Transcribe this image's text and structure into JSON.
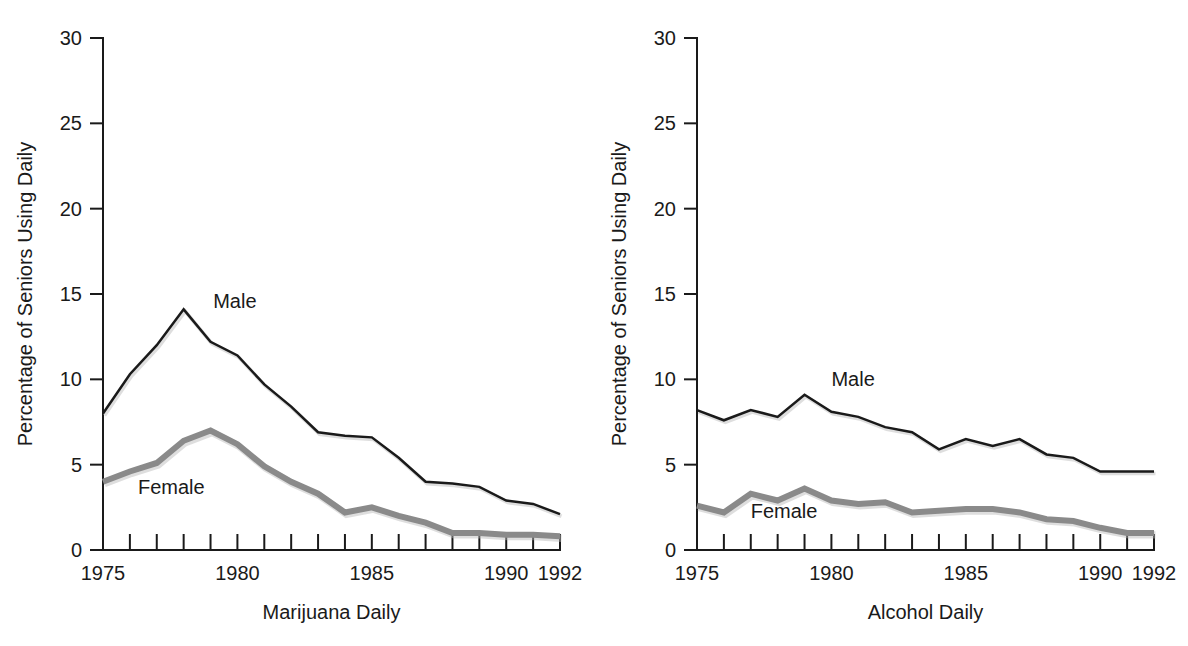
{
  "figure": {
    "background": "#ffffff",
    "panel_count": 2
  },
  "chart_data": [
    {
      "type": "line",
      "title": "",
      "xlabel": "Marijuana Daily",
      "ylabel": "Percentage of Seniors Using Daily",
      "xlim": [
        1975,
        1992
      ],
      "ylim": [
        0,
        30
      ],
      "yticks": [
        0,
        5,
        10,
        15,
        20,
        25,
        30
      ],
      "ytick_labels": [
        "0",
        "5",
        "10",
        "15",
        "20",
        "25",
        "30"
      ],
      "xticks": [
        1975,
        1976,
        1977,
        1978,
        1979,
        1980,
        1981,
        1982,
        1983,
        1984,
        1985,
        1986,
        1987,
        1988,
        1989,
        1990,
        1991,
        1992
      ],
      "xtick_labels_shown": [
        "1975",
        "1980",
        "1985",
        "1990",
        "1992"
      ],
      "xtick_labels_shown_at": [
        1975,
        1980,
        1985,
        1990,
        1992
      ],
      "grid": false,
      "legend": "inline-annotations",
      "x": [
        1975,
        1976,
        1977,
        1978,
        1979,
        1980,
        1981,
        1982,
        1983,
        1984,
        1985,
        1986,
        1987,
        1988,
        1989,
        1990,
        1991,
        1992
      ],
      "series": [
        {
          "name": "Male",
          "color": "#1a1a1a",
          "stroke_width": 2.5,
          "label_x": 1979.1,
          "label_y": 14.2,
          "values": [
            8.0,
            10.3,
            12.0,
            14.1,
            12.2,
            11.4,
            9.7,
            8.4,
            6.9,
            6.7,
            6.6,
            5.4,
            4.0,
            3.9,
            3.7,
            2.9,
            2.7,
            2.1
          ]
        },
        {
          "name": "Female",
          "color": "#8a8a8a",
          "stroke_width": 6,
          "label_x": 1976.3,
          "label_y": 3.3,
          "values": [
            4.0,
            4.6,
            5.1,
            6.4,
            7.0,
            6.2,
            4.9,
            4.0,
            3.3,
            2.2,
            2.5,
            2.0,
            1.6,
            1.0,
            1.0,
            0.9,
            0.9,
            0.8
          ]
        }
      ]
    },
    {
      "type": "line",
      "title": "",
      "xlabel": "Alcohol Daily",
      "ylabel": "Percentage of Seniors Using Daily",
      "xlim": [
        1975,
        1992
      ],
      "ylim": [
        0,
        30
      ],
      "yticks": [
        0,
        5,
        10,
        15,
        20,
        25,
        30
      ],
      "ytick_labels": [
        "0",
        "5",
        "10",
        "15",
        "20",
        "25",
        "30"
      ],
      "xticks": [
        1975,
        1976,
        1977,
        1978,
        1979,
        1980,
        1981,
        1982,
        1983,
        1984,
        1985,
        1986,
        1987,
        1988,
        1989,
        1990,
        1991,
        1992
      ],
      "xtick_labels_shown": [
        "1975",
        "1980",
        "1985",
        "1990",
        "1992"
      ],
      "xtick_labels_shown_at": [
        1975,
        1980,
        1985,
        1990,
        1992
      ],
      "grid": false,
      "legend": "inline-annotations",
      "x": [
        1975,
        1976,
        1977,
        1978,
        1979,
        1980,
        1981,
        1982,
        1983,
        1984,
        1985,
        1986,
        1987,
        1988,
        1989,
        1990,
        1991,
        1992
      ],
      "series": [
        {
          "name": "Male",
          "color": "#1a1a1a",
          "stroke_width": 2.5,
          "label_x": 1980.0,
          "label_y": 9.6,
          "values": [
            8.2,
            7.6,
            8.2,
            7.8,
            9.1,
            8.1,
            7.8,
            7.2,
            6.9,
            5.9,
            6.5,
            6.1,
            6.5,
            5.6,
            5.4,
            4.6,
            4.6,
            4.6
          ]
        },
        {
          "name": "Female",
          "color": "#8a8a8a",
          "stroke_width": 6,
          "label_x": 1977.0,
          "label_y": 1.9,
          "values": [
            2.6,
            2.2,
            3.3,
            2.9,
            3.6,
            2.9,
            2.7,
            2.8,
            2.2,
            2.3,
            2.4,
            2.4,
            2.2,
            1.8,
            1.7,
            1.3,
            1.0,
            1.0
          ]
        }
      ]
    }
  ],
  "panels": [
    {
      "id": "marijuana-panel",
      "xlabel": "Marijuana Daily",
      "ylabel": "Percentage of Seniors Using Daily"
    },
    {
      "id": "alcohol-panel",
      "xlabel": "Alcohol Daily",
      "ylabel": "Percentage of Seniors Using Daily"
    }
  ]
}
